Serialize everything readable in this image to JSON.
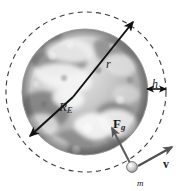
{
  "figure": {
    "type": "physics-diagram",
    "background_color": "#ffffff",
    "stroke_color": "#1a1a1a"
  },
  "earth": {
    "name": "earth-sphere",
    "description": "grayscale satellite photograph of Earth",
    "center": {
      "x": 85,
      "y": 92
    },
    "radius": 63,
    "fill_light": "#e8e8e8",
    "fill_dark": "#8d8d8d"
  },
  "orbit": {
    "name": "orbit-circle",
    "style": "dashed",
    "center": {
      "x": 86,
      "y": 92
    },
    "radius": 80,
    "color": "#3a3a3a"
  },
  "satellite": {
    "name": "satellite-body",
    "center": {
      "x": 132,
      "y": 167
    },
    "radius": 5,
    "mass_label": "m"
  },
  "labels": {
    "orbital_radius": "r",
    "earth_radius_symbol": "R",
    "earth_radius_subscript": "E",
    "altitude": "h",
    "gravitational_force_symbol": "F",
    "gravitational_force_subscript": "g",
    "velocity": "v",
    "mass": "m"
  },
  "vectors": [
    {
      "name": "orbital-radius-vector",
      "label": "r",
      "from": {
        "x": 73,
        "y": 97
      },
      "to": {
        "x": 133,
        "y": 22
      },
      "arrowheads": "single",
      "color": "#111111"
    },
    {
      "name": "earth-radius-vector",
      "label": "R_E",
      "from": {
        "x": 73,
        "y": 97
      },
      "to": {
        "x": 30,
        "y": 136
      },
      "arrowheads": "single",
      "color": "#111111"
    },
    {
      "name": "altitude-measure",
      "label": "h",
      "from": {
        "x": 146,
        "y": 89
      },
      "to": {
        "x": 166,
        "y": 89
      },
      "arrowheads": "double",
      "color": "#111111"
    },
    {
      "name": "gravitational-force-vector",
      "label": "F_g",
      "from": {
        "x": 129,
        "y": 162
      },
      "to": {
        "x": 111,
        "y": 127
      },
      "arrowheads": "single",
      "color": "#5a5a5a"
    },
    {
      "name": "velocity-vector",
      "label": "v",
      "from": {
        "x": 137,
        "y": 166
      },
      "to": {
        "x": 171,
        "y": 148
      },
      "arrowheads": "single",
      "color": "#4a4a4a"
    }
  ]
}
